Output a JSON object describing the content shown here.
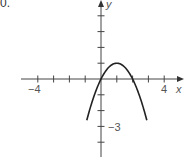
{
  "problem": {
    "number_label": "0."
  },
  "chart_data": {
    "type": "line",
    "title": "",
    "xlabel": "x",
    "ylabel": "y",
    "xlim": [
      -4.8,
      5
    ],
    "ylim": [
      -4.5,
      4.6
    ],
    "grid": false,
    "x_ticks": [
      -4,
      -3,
      -2,
      -1,
      1,
      2,
      3,
      4
    ],
    "y_ticks": [
      -4,
      -3,
      -2,
      -1,
      1,
      2,
      3,
      4
    ],
    "x_tick_labels": {
      "-4": "−4",
      "4": "4"
    },
    "y_tick_labels": {
      "-3": "−3"
    },
    "series": [
      {
        "name": "parabola",
        "equation": "y = -x^2 + 2x",
        "x": [
          -0.9,
          -0.5,
          0,
          0.5,
          1,
          1.5,
          2,
          2.5,
          2.9
        ],
        "y": [
          -3.61,
          -1.25,
          0,
          0.75,
          1,
          0.75,
          0,
          -1.25,
          -3.61
        ],
        "color": "#222222"
      }
    ]
  },
  "labels": {
    "x_axis": "x",
    "y_axis": "y",
    "x_neg4": "−4",
    "x_pos4": "4",
    "y_neg3": "−3"
  }
}
